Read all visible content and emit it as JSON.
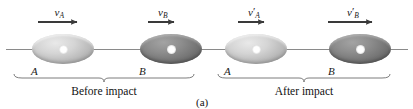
{
  "figure": {
    "caption": "(a)",
    "baseline": {
      "color": "#8a8a8a"
    }
  },
  "phases": [
    {
      "key": "before",
      "label": "Before impact"
    },
    {
      "key": "after",
      "label": "After impact"
    }
  ],
  "bodies": [
    {
      "id": "A-before",
      "letter": "A",
      "shade": "light",
      "cx": 63,
      "cy": 49,
      "rx": 31,
      "ry": 15
    },
    {
      "id": "B-before",
      "letter": "B",
      "shade": "dark",
      "cx": 171,
      "cy": 49,
      "rx": 31,
      "ry": 15
    },
    {
      "id": "A-after",
      "letter": "A",
      "shade": "light",
      "cx": 256,
      "cy": 49,
      "rx": 31,
      "ry": 15
    },
    {
      "id": "B-after",
      "letter": "B",
      "shade": "dark",
      "cx": 360,
      "cy": 49,
      "rx": 31,
      "ry": 15
    }
  ],
  "velocities": [
    {
      "id": "vA",
      "symbol": "v",
      "subscript": "A",
      "prime": "",
      "label": "vA",
      "x1": 38,
      "x2": 83,
      "y": 22
    },
    {
      "id": "vB",
      "symbol": "v",
      "subscript": "B",
      "prime": "",
      "label": "vB",
      "x1": 148,
      "x2": 180,
      "y": 22
    },
    {
      "id": "vAp",
      "symbol": "v",
      "subscript": "A",
      "prime": "′",
      "label": "v'A",
      "x1": 238,
      "x2": 270,
      "y": 22
    },
    {
      "id": "vBp",
      "symbol": "v",
      "subscript": "B",
      "prime": "′",
      "label": "v'B",
      "x1": 328,
      "x2": 378,
      "y": 22
    }
  ],
  "brackets": [
    {
      "key": "before",
      "x1": 14,
      "x2": 194,
      "y": 78,
      "label": "Before impact",
      "label_y": 86
    },
    {
      "key": "after",
      "x1": 218,
      "x2": 390,
      "y": 78,
      "label": "After impact",
      "label_y": 86
    }
  ],
  "colors": {
    "ink": "#1a1a1a",
    "line": "#8a8a8a",
    "arrow": "#3a3a3a",
    "bracket": "#6e6e6e"
  }
}
